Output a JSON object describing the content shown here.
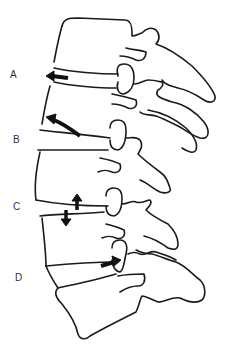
{
  "figure": {
    "type": "lateral lumbar spine line drawing",
    "labels": [
      {
        "id": "A",
        "text": "A",
        "x": 10,
        "y": 69
      },
      {
        "id": "B",
        "text": "B",
        "x": 13,
        "y": 134
      },
      {
        "id": "C",
        "text": "C",
        "x": 13,
        "y": 201
      },
      {
        "id": "D",
        "text": "D",
        "x": 15,
        "y": 272
      }
    ],
    "arrows": [
      {
        "id": "A",
        "direction": "left",
        "description": "anterior disc bulge"
      },
      {
        "id": "B",
        "direction": "up-left",
        "description": "curved arrow along endplate"
      },
      {
        "id": "C",
        "direction": "up and down",
        "description": "paired opposing vertical arrows (disc height)"
      },
      {
        "id": "D",
        "direction": "right",
        "description": "posterior arrow toward facet"
      }
    ],
    "colors": {
      "line": "#1a1a1a",
      "label": "#333333",
      "background": "#ffffff"
    }
  }
}
